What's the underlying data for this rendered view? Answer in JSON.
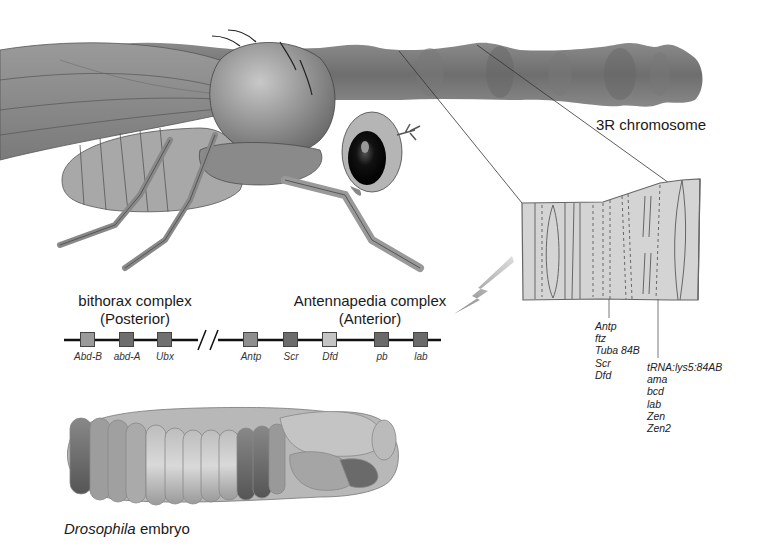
{
  "figure": {
    "chromosome_label": "3R chromosome",
    "bithorax": {
      "title": "bithorax complex",
      "subtitle": "(Posterior)"
    },
    "antennapedia": {
      "title": "Antennapedia complex",
      "subtitle": "(Anterior)"
    },
    "gene_map": {
      "bithorax_genes": [
        {
          "name": "Abd-B",
          "x": 80,
          "color": "#9a9a9a"
        },
        {
          "name": "abd-A",
          "x": 119,
          "color": "#6e6e6e"
        },
        {
          "name": "Ubx",
          "x": 157,
          "color": "#707070"
        }
      ],
      "antennapedia_genes": [
        {
          "name": "Antp",
          "x": 243,
          "color": "#8e8e8e"
        },
        {
          "name": "Scr",
          "x": 283,
          "color": "#6c6c6c"
        },
        {
          "name": "Dfd",
          "x": 322,
          "color": "#c4c4c4"
        },
        {
          "name": "pb",
          "x": 374,
          "color": "#6a6a6a"
        },
        {
          "name": "lab",
          "x": 413,
          "color": "#6a6a6a"
        }
      ],
      "break_symbol": "//"
    },
    "band_list_1": [
      "Antp",
      "ftz",
      "Tuba 84B",
      "Scr",
      "Dfd"
    ],
    "band_list_2": [
      "tRNA:lys5:84AB",
      "ama",
      "bcd",
      "lab",
      "Zen",
      "Zen2"
    ],
    "embryo_caption": {
      "italic": "Drosophila",
      "rest": " embryo"
    }
  }
}
